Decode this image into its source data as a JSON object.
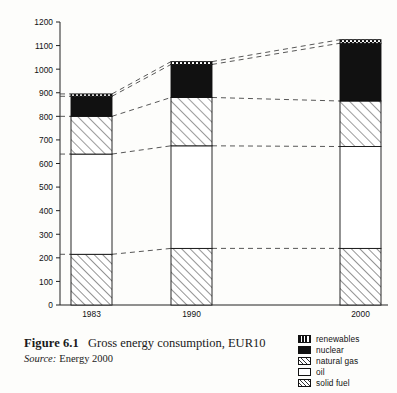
{
  "figure": {
    "label": "Figure 6.1",
    "title": "Gross energy consumption, EUR10",
    "source_word": "Source:",
    "source_text": "Energy 2000"
  },
  "legend": {
    "items": [
      {
        "key": "renewables",
        "label": "renewables",
        "pattern": "checker-dots"
      },
      {
        "key": "nuclear",
        "label": "nuclear",
        "pattern": "solid-black"
      },
      {
        "key": "natural_gas",
        "label": "natural gas",
        "pattern": "diagonal-hatch-light"
      },
      {
        "key": "oil",
        "label": "oil",
        "pattern": "empty-white"
      },
      {
        "key": "solid_fuel",
        "label": "solid fuel",
        "pattern": "diagonal-hatch"
      }
    ]
  },
  "chart_data": {
    "type": "bar",
    "subtype": "stacked-column",
    "title": "Gross energy consumption, EUR10",
    "xlabel": "",
    "ylabel": "",
    "categories": [
      "1983",
      "1990",
      "2000"
    ],
    "ylim": [
      0,
      1200
    ],
    "ytick_step": 100,
    "yticks": [
      0,
      100,
      200,
      300,
      400,
      500,
      600,
      700,
      800,
      900,
      1000,
      1100,
      1200
    ],
    "ytick_labels": [
      "0",
      "100",
      "200",
      "300",
      "400",
      "500",
      "600",
      "700",
      "800",
      "900",
      "1000",
      "1100",
      "1200"
    ],
    "grid": false,
    "legend_position": "bottom-right",
    "connector_lines": "dashed",
    "series": [
      {
        "name": "solid fuel",
        "key": "solid_fuel",
        "values": [
          215,
          240,
          240
        ]
      },
      {
        "name": "oil",
        "key": "oil",
        "values": [
          425,
          435,
          432
        ]
      },
      {
        "name": "natural gas",
        "key": "natural_gas",
        "values": [
          160,
          205,
          193
        ]
      },
      {
        "name": "nuclear",
        "key": "nuclear",
        "values": [
          85,
          140,
          245
        ]
      },
      {
        "name": "renewables",
        "key": "renewables",
        "values": [
          10,
          12,
          15
        ]
      }
    ],
    "cumulative_tops": {
      "solid_fuel": [
        215,
        240,
        240
      ],
      "oil": [
        640,
        675,
        672
      ],
      "natural_gas": [
        800,
        880,
        865
      ],
      "nuclear": [
        885,
        1020,
        1110
      ],
      "renewables": [
        895,
        1032,
        1125
      ]
    },
    "totals": [
      895,
      1032,
      1125
    ]
  }
}
